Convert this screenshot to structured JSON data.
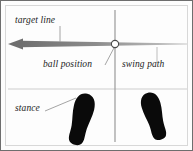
{
  "figure": {
    "background_color": "#fdfdfd",
    "border_color": "#6e6e6e",
    "inner_frame_color": "#d8d8d8"
  },
  "labels": {
    "target_line": "target line",
    "ball_position": "ball position",
    "swing_path": "swing path",
    "stance": "stance"
  },
  "colors": {
    "target_line": "#8a8a8a",
    "swing_path": "#9a9a9a",
    "ground_line": "#dcdcdc",
    "leader_line": "#9a9a9a",
    "footprint": "#0a0a0a",
    "ball_fill": "#ffffff",
    "ball_stroke": "#4a4a4a",
    "text": "#1c1c1c"
  },
  "diagram_data": {
    "type": "diagram",
    "subject": "golf setup alignment: target line, swing path, ball position and stance",
    "elements": [
      {
        "name": "target-line",
        "kind": "tapered-arrow",
        "direction": "left",
        "from_x": 186,
        "to_x": 7,
        "y": 43,
        "arrowhead": "left"
      },
      {
        "name": "swing-path-line",
        "kind": "vertical-line",
        "x": 114,
        "from_y": 9,
        "to_y": 141
      },
      {
        "name": "ground-line",
        "kind": "horizontal-line",
        "y": 88,
        "from_x": 7,
        "to_x": 186
      },
      {
        "name": "golf-ball",
        "kind": "circle",
        "cx": 114,
        "cy": 43,
        "r": 3.6
      },
      {
        "name": "left-footprint",
        "kind": "shoe-sole",
        "cx": 80,
        "cy": 118,
        "rotation_deg": 14
      },
      {
        "name": "right-footprint",
        "kind": "shoe-sole",
        "cx": 153,
        "cy": 115,
        "rotation_deg": -16
      }
    ],
    "leaders": [
      {
        "name": "target-line-leader",
        "x1": 59,
        "y1": 25,
        "x2": 59,
        "y2": 41
      },
      {
        "name": "ball-position-leader",
        "x1": 104,
        "y1": 65,
        "x2": 113,
        "y2": 47
      },
      {
        "name": "swing-path-leader",
        "x1": 156,
        "y1": 47,
        "x2": 156,
        "y2": 62
      },
      {
        "name": "stance-leader",
        "x1": 44,
        "y1": 110,
        "x2": 73,
        "y2": 98
      }
    ]
  }
}
